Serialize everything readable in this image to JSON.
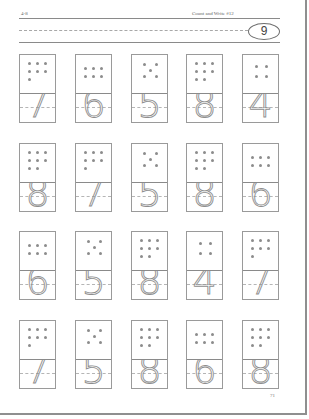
{
  "header": {
    "section_label": "4-8",
    "title": "Count and Write #12",
    "badge_number": "9"
  },
  "colors": {
    "line": "#8a8a8a",
    "dot": "#8c8c8c",
    "numeral_stroke": "#8e8e8e",
    "page_border": "#8f8f8f"
  },
  "rows": [
    {
      "cards": [
        {
          "dots": 7,
          "numeral": "7"
        },
        {
          "dots": 6,
          "numeral": "6"
        },
        {
          "dots": 5,
          "numeral": "5"
        },
        {
          "dots": 8,
          "numeral": "8"
        },
        {
          "dots": 4,
          "numeral": "4"
        }
      ]
    },
    {
      "cards": [
        {
          "dots": 8,
          "numeral": "8"
        },
        {
          "dots": 7,
          "numeral": "7"
        },
        {
          "dots": 5,
          "numeral": "5"
        },
        {
          "dots": 8,
          "numeral": "8"
        },
        {
          "dots": 6,
          "numeral": "6"
        }
      ]
    },
    {
      "cards": [
        {
          "dots": 6,
          "numeral": "6"
        },
        {
          "dots": 5,
          "numeral": "5"
        },
        {
          "dots": 8,
          "numeral": "8"
        },
        {
          "dots": 4,
          "numeral": "4"
        },
        {
          "dots": 7,
          "numeral": "7"
        }
      ]
    },
    {
      "cards": [
        {
          "dots": 7,
          "numeral": "7"
        },
        {
          "dots": 5,
          "numeral": "5"
        },
        {
          "dots": 8,
          "numeral": "8"
        },
        {
          "dots": 6,
          "numeral": "6"
        },
        {
          "dots": 8,
          "numeral": "8"
        }
      ]
    }
  ],
  "footer": {
    "page_number": "71"
  }
}
